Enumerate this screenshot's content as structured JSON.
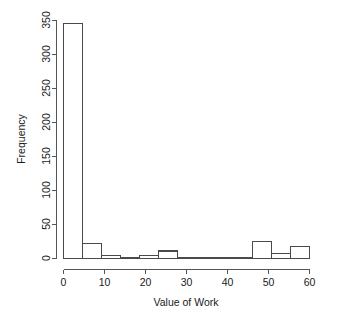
{
  "chart_data": {
    "type": "bar",
    "title": "",
    "xlabel": "Value of Work",
    "ylabel": "Frequency",
    "xlim": [
      0,
      65
    ],
    "ylim": [
      0,
      350
    ],
    "grid": false,
    "legend": null,
    "bin_width": 5,
    "bin_edges": [
      0,
      5,
      10,
      15,
      20,
      25,
      30,
      35,
      40,
      45,
      50,
      55,
      60,
      65
    ],
    "categories": [
      "0-5",
      "5-10",
      "10-15",
      "15-20",
      "20-25",
      "25-30",
      "30-35",
      "35-40",
      "40-45",
      "45-50",
      "50-55",
      "55-60",
      "60-65"
    ],
    "values": [
      345,
      22,
      4,
      2,
      5,
      11,
      2,
      2,
      1,
      1,
      25,
      7,
      17
    ],
    "xticks": [
      0,
      10,
      20,
      30,
      40,
      50,
      60
    ],
    "xtick_labels": [
      "0",
      "10",
      "20",
      "30",
      "40",
      "50",
      "60"
    ],
    "yticks": [
      0,
      50,
      100,
      150,
      200,
      250,
      300,
      350
    ],
    "ytick_labels": [
      "0",
      "50",
      "100",
      "150",
      "200",
      "250",
      "300",
      "350"
    ]
  },
  "axis": {
    "x_title": "Value of Work",
    "y_title": "Frequency"
  },
  "ytick_labels": {
    "t0": "0",
    "t1": "50",
    "t2": "100",
    "t3": "150",
    "t4": "200",
    "t5": "250",
    "t6": "300",
    "t7": "350"
  },
  "xtick_labels": {
    "t0": "0",
    "t1": "10",
    "t2": "20",
    "t3": "30",
    "t4": "40",
    "t5": "50",
    "t6": "60"
  },
  "colors": {
    "bar_fill": "#ffffff",
    "bar_stroke": "#4a4a4a",
    "axis": "#555555",
    "text": "#1a1a1a",
    "background": "#ffffff"
  }
}
